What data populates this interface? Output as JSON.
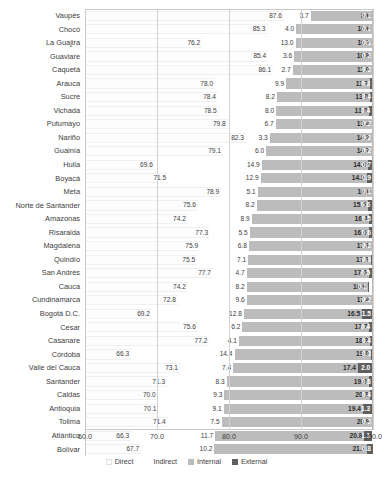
{
  "chart_data": {
    "type": "bar",
    "subtype": "stacked-horizontal-bar",
    "title": "",
    "xlabel": "",
    "ylabel": "",
    "xlim": [
      60.0,
      100.0
    ],
    "xticks": [
      "60.0",
      "70.0",
      "80.0",
      "90.0",
      "100.0"
    ],
    "xtick_values": [
      60.0,
      70.0,
      80.0,
      90.0,
      100.0
    ],
    "grid": true,
    "legend_position": "bottom",
    "stack_total": 100.0,
    "categories": [
      "Vaupés",
      "Chocó",
      "La Guajira",
      "Guaviare",
      "Caquetá",
      "Arauca",
      "Sucre",
      "Vichada",
      "Putumayo",
      "Nariño",
      "Guainía",
      "Huila",
      "Boyacá",
      "Meta",
      "Norte de Santander",
      "Amazonas",
      "Risaralda",
      "Magdalena",
      "Quindío",
      "San Andrés",
      "Cauca",
      "Cundinamarca",
      "Bogotá D.C.",
      "Cesar",
      "Casanare",
      "Córdoba",
      "Valle del Cauca",
      "Santander",
      "Caldas",
      "Antioquia",
      "Tolima",
      "Atlántico",
      "Bolívar"
    ],
    "series": [
      {
        "name": "Direct",
        "color": "#fdfdfd",
        "values": [
          87.6,
          85.3,
          76.2,
          85.4,
          86.1,
          78.0,
          78.4,
          78.5,
          79.8,
          82.3,
          79.1,
          69.6,
          71.5,
          78.9,
          75.6,
          74.2,
          77.3,
          75.9,
          75.5,
          77.7,
          74.2,
          72.8,
          69.2,
          75.6,
          77.2,
          66.3,
          73.1,
          71.3,
          70.0,
          70.1,
          71.4,
          66.3,
          67.7
        ]
      },
      {
        "name": "Indirect",
        "color": "#ffffff",
        "values": [
          3.7,
          4.0,
          13.0,
          3.6,
          2.7,
          9.9,
          8.2,
          8.0,
          6.7,
          3.3,
          6.0,
          14.9,
          12.9,
          5.1,
          8.2,
          8.9,
          5.5,
          6.8,
          7.1,
          4.7,
          8.2,
          9.6,
          12.8,
          6.2,
          4.1,
          14.4,
          7.4,
          8.3,
          9.3,
          9.1,
          7.5,
          11.7,
          10.2
        ]
      },
      {
        "name": "Internal",
        "color": "#bcbcbc",
        "values": [
          8.6,
          10.6,
          10.7,
          10.8,
          11.0,
          11.7,
          13.0,
          13.0,
          13.4,
          14.2,
          14.7,
          14.8,
          14.8,
          16.0,
          15.5,
          16.4,
          16.6,
          17.1,
          17.1,
          17.0,
          16.9,
          17.4,
          16.5,
          17.7,
          18.3,
          19.0,
          17.4,
          19.8,
          20.3,
          19.4,
          20.9,
          20.8,
          21.3
        ]
      },
      {
        "name": "External",
        "color": "#5f5f5f",
        "values": [
          0.1,
          0.1,
          0.1,
          0.2,
          0.2,
          0.3,
          0.4,
          0.4,
          0.2,
          0.2,
          0.2,
          0.7,
          0.9,
          0.1,
          0.6,
          0.5,
          0.6,
          0.2,
          0.3,
          0.5,
          0.1,
          0.2,
          1.5,
          0.4,
          0.4,
          0.3,
          2.0,
          0.6,
          0.4,
          1.3,
          0.2,
          1.1,
          0.8
        ]
      }
    ]
  },
  "legend": {
    "items": [
      {
        "label": "Direct",
        "icon": "square-swatch-icon",
        "color": "#fdfdfd"
      },
      {
        "label": "Indirect",
        "icon": "square-swatch-icon",
        "color": "#ffffff"
      },
      {
        "label": "Internal",
        "icon": "square-swatch-icon",
        "color": "#bcbcbc"
      },
      {
        "label": "External",
        "icon": "square-swatch-icon",
        "color": "#5f5f5f"
      }
    ]
  }
}
